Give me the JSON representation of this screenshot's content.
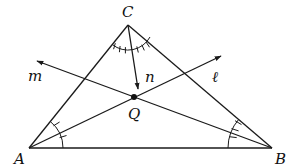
{
  "diagram": {
    "type": "geometry",
    "stroke_color": "#1a1a1a",
    "points": {
      "A": {
        "label": "A",
        "x": 29,
        "y": 148
      },
      "B": {
        "label": "B",
        "x": 272,
        "y": 148
      },
      "C": {
        "label": "C",
        "x": 128,
        "y": 25
      },
      "Q": {
        "label": "Q",
        "x": 134,
        "y": 97
      }
    },
    "rays": [
      {
        "name": "m",
        "label": "m",
        "from": "B",
        "through": "Q"
      },
      {
        "name": "l",
        "label": "ℓ",
        "from": "A",
        "through": "Q"
      },
      {
        "name": "n",
        "label": "n",
        "from": "C",
        "toward": "Q"
      }
    ],
    "angle_marks": {
      "A": {
        "ticks": 2
      },
      "B": {
        "ticks": 3
      },
      "C": {
        "ticks": 6
      }
    }
  }
}
